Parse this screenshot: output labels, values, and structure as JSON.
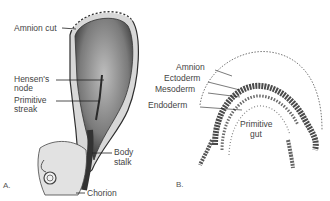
{
  "figure": {
    "panels": [
      {
        "id": "A",
        "letter": "A.",
        "labels": {
          "amnion_cut": "Amnion cut",
          "hensens_node_line1": "Hensen's",
          "hensens_node_line2": "node",
          "primitive_streak_line1": "Primitive",
          "primitive_streak_line2": "streak",
          "body_stalk_line1": "Body",
          "body_stalk_line2": "stalk",
          "chorion": "Chorion"
        }
      },
      {
        "id": "B",
        "letter": "B.",
        "labels": {
          "amnion": "Amnion",
          "ectoderm": "Ectoderm",
          "mesoderm": "Mesoderm",
          "endoderm": "Endoderm",
          "primitive_gut_line1": "Primitive",
          "primitive_gut_line2": "gut"
        }
      }
    ],
    "colors": {
      "background": "#ffffff",
      "ink": "#3a3a3a",
      "tissue_dark": "#4a4a4a",
      "tissue_mid": "#8a8a8a",
      "tissue_light": "#d6d6d6"
    }
  }
}
